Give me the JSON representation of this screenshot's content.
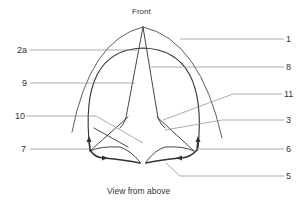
{
  "diagram": {
    "title": "Front",
    "caption": "View from above",
    "labels": {
      "l1": "1",
      "l2a": "2a",
      "l3": "3",
      "l5": "5",
      "l6": "6",
      "l7": "7",
      "l8": "8",
      "l9": "9",
      "l10": "10",
      "l11": "11"
    },
    "colors": {
      "line": "#333333",
      "leader": "#888888",
      "background": "#ffffff"
    }
  }
}
